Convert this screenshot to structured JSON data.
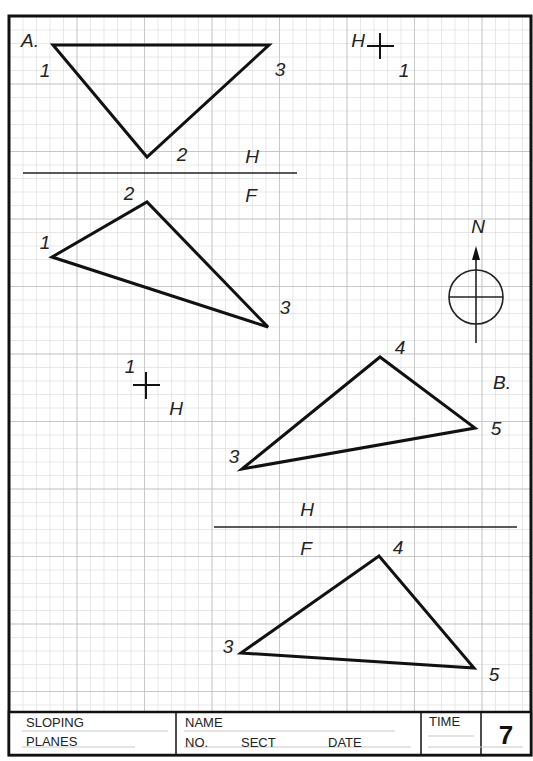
{
  "sheet": {
    "grid_spacing_px": 13.5,
    "colors": {
      "grid": "#cfcfcf",
      "ink": "#111111",
      "paper": "#ffffff"
    }
  },
  "problem_a": {
    "label": "A.",
    "top_view": {
      "plane_label_upper": "H",
      "plane_label_lower": "F",
      "vertices": [
        {
          "id": "1",
          "label": "1",
          "x": 53,
          "y": 45
        },
        {
          "id": "3",
          "label": "3",
          "x": 269,
          "y": 45
        },
        {
          "id": "2",
          "label": "2",
          "x": 147,
          "y": 157
        }
      ]
    },
    "front_view": {
      "vertices": [
        {
          "id": "1",
          "label": "1",
          "x": 52,
          "y": 257
        },
        {
          "id": "2",
          "label": "2",
          "x": 147,
          "y": 202
        },
        {
          "id": "3",
          "label": "3",
          "x": 268,
          "y": 327
        }
      ]
    },
    "point_marker_h": {
      "label_h": "H",
      "label_1": "1"
    },
    "point_marker_1": {
      "label_1": "1",
      "label_h": "H"
    }
  },
  "north_arrow": {
    "label": "N"
  },
  "problem_b": {
    "label": "B.",
    "top_view": {
      "vertices": [
        {
          "id": "3",
          "label": "3",
          "x": 242,
          "y": 469
        },
        {
          "id": "4",
          "label": "4",
          "x": 380,
          "y": 357
        },
        {
          "id": "5",
          "label": "5",
          "x": 475,
          "y": 428
        }
      ]
    },
    "plane_label_upper": "H",
    "plane_label_lower": "F",
    "front_view": {
      "vertices": [
        {
          "id": "3",
          "label": "3",
          "x": 241,
          "y": 653
        },
        {
          "id": "4",
          "label": "4",
          "x": 379,
          "y": 556
        },
        {
          "id": "5",
          "label": "5",
          "x": 474,
          "y": 668
        }
      ]
    }
  },
  "title_block": {
    "title_line1": "SLOPING",
    "title_line2": "PLANES",
    "name_label": "NAME",
    "no_label": "NO.",
    "sect_label": "SECT",
    "date_label": "DATE",
    "time_label": "TIME",
    "sheet_number": "7"
  }
}
